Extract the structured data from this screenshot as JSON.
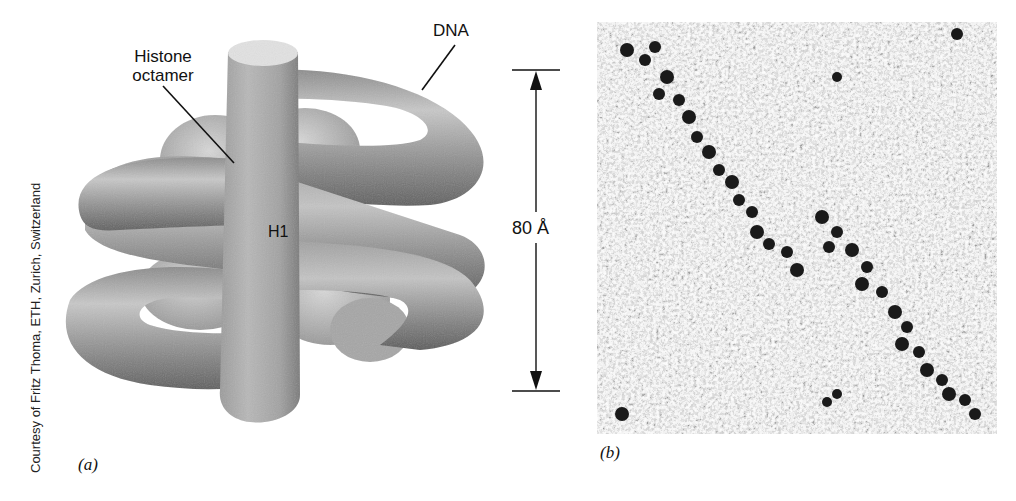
{
  "figure": {
    "panel_a": {
      "panel_label": "(a)",
      "labels": {
        "histone_octamer": "Histone octamer",
        "histone_line1": "Histone",
        "histone_line2": "octamer",
        "dna": "DNA",
        "h1": "H1",
        "dimension": "80 Å"
      },
      "credit": "Courtesy of Fritz Thoma, ETH, Zurich, Switzerland",
      "description": "3D model of a nucleosome: DNA wrapped around a histone octamer with linker histone H1 rod, 80 Å height scale bar"
    },
    "panel_b": {
      "panel_label": "(b)",
      "description": "Electron micrograph showing nucleosome fibers (chromatin) as chains of dark particles on a granular background"
    },
    "colors": {
      "background": "#ffffff",
      "model_light": "#d4d4d4",
      "model_mid": "#9a9a9a",
      "model_dark": "#5e5e5e",
      "text": "#111111"
    }
  }
}
